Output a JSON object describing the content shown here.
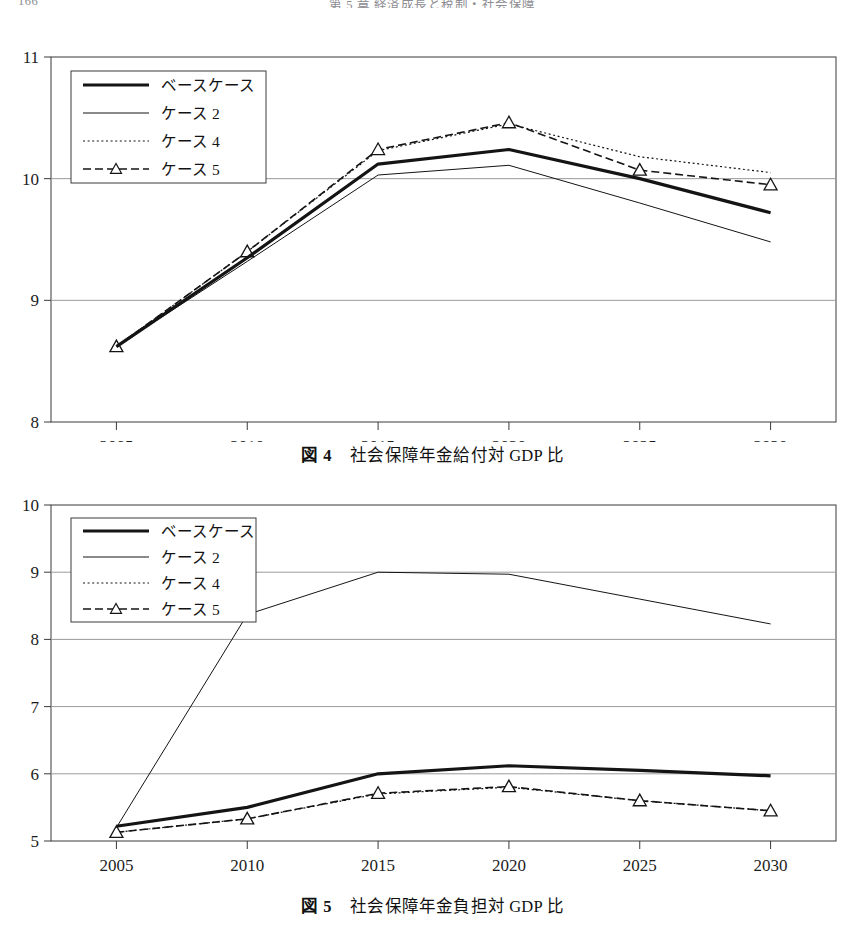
{
  "header": {
    "folio": "166",
    "title": "第 5 章  経済成長と税制・社会保障"
  },
  "figures": [
    {
      "id": "figure-4",
      "caption_label": "図 4",
      "caption_text": "社会保障年金給付対 GDP 比"
    },
    {
      "id": "figure-5",
      "caption_label": "図 5",
      "caption_text": "社会保障年金負担対 GDP 比"
    }
  ],
  "legend": {
    "items": [
      {
        "label": "ベースケース",
        "style": "thick-solid",
        "marker": "none"
      },
      {
        "label": "ケース 2",
        "style": "thin-solid",
        "marker": "none"
      },
      {
        "label": "ケース 4",
        "style": "dotted",
        "marker": "none"
      },
      {
        "label": "ケース 5",
        "style": "dash-dot",
        "marker": "triangle"
      }
    ]
  },
  "chart_data": [
    {
      "type": "line",
      "title": "社会保障年金給付対 GDP 比",
      "figure_label": "図 4",
      "xlabel": "",
      "ylabel": "",
      "x": [
        2005,
        2010,
        2015,
        2020,
        2025,
        2030
      ],
      "xticklabels": [
        "2005",
        "2010",
        "2015",
        "2020",
        "2025",
        "2030"
      ],
      "yticklabels": [
        "8",
        "9",
        "10",
        "11"
      ],
      "xlim": [
        2003,
        2032
      ],
      "ylim": [
        8,
        11
      ],
      "ytick_step": 1,
      "grid": "horizontal",
      "legend_position": "upper-left-inside",
      "series": [
        {
          "name": "ベースケース",
          "style": "thick-solid",
          "marker": "none",
          "values": [
            8.62,
            9.35,
            10.12,
            10.24,
            10.0,
            9.72
          ]
        },
        {
          "name": "ケース 2",
          "style": "thin-solid",
          "marker": "none",
          "values": [
            8.62,
            9.32,
            10.03,
            10.11,
            9.8,
            9.48
          ]
        },
        {
          "name": "ケース 4",
          "style": "dotted",
          "marker": "none",
          "values": [
            8.62,
            9.4,
            10.23,
            10.45,
            10.18,
            10.05
          ]
        },
        {
          "name": "ケース 5",
          "style": "dash-dot",
          "marker": "triangle",
          "values": [
            8.62,
            9.4,
            10.24,
            10.46,
            10.07,
            9.95
          ]
        }
      ]
    },
    {
      "type": "line",
      "title": "社会保障年金負担対 GDP 比",
      "figure_label": "図 5",
      "xlabel": "",
      "ylabel": "",
      "x": [
        2005,
        2010,
        2015,
        2020,
        2025,
        2030
      ],
      "xticklabels": [
        "2005",
        "2010",
        "2015",
        "2020",
        "2025",
        "2030"
      ],
      "yticklabels": [
        "5",
        "6",
        "7",
        "8",
        "9",
        "10"
      ],
      "xlim": [
        2003,
        2032
      ],
      "ylim": [
        5,
        10
      ],
      "ytick_step": 1,
      "grid": "horizontal",
      "legend_position": "upper-left-inside",
      "series": [
        {
          "name": "ベースケース",
          "style": "thick-solid",
          "marker": "none",
          "values": [
            5.22,
            5.5,
            6.0,
            6.12,
            6.05,
            5.97
          ]
        },
        {
          "name": "ケース 2",
          "style": "thin-solid",
          "marker": "none",
          "values": [
            5.2,
            8.37,
            9.0,
            8.97,
            8.6,
            8.23
          ]
        },
        {
          "name": "ケース 4",
          "style": "dotted",
          "marker": "none",
          "values": [
            5.13,
            5.33,
            5.7,
            5.8,
            5.6,
            5.45
          ]
        },
        {
          "name": "ケース 5",
          "style": "dash-dot",
          "marker": "triangle",
          "values": [
            5.13,
            5.33,
            5.71,
            5.81,
            5.6,
            5.45
          ]
        }
      ]
    }
  ]
}
